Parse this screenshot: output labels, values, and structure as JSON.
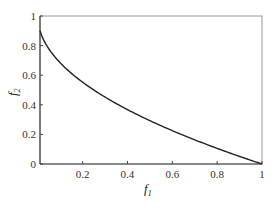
{
  "chart_data": {
    "type": "line",
    "title": "",
    "xlabel": "f1",
    "ylabel": "f2",
    "xlim": [
      0.01,
      1.0
    ],
    "ylim": [
      0,
      1
    ],
    "grid": false,
    "legend": null,
    "xticks": [
      "0.2",
      "0.4",
      "0.6",
      "0.8",
      "1"
    ],
    "yticks": [
      "0",
      "0.2",
      "0.4",
      "0.6",
      "0.8",
      "1"
    ],
    "series": [
      {
        "name": "Pareto front",
        "color": "#222222",
        "x": [
          0.01,
          0.05,
          0.1,
          0.15,
          0.2,
          0.3,
          0.4,
          0.5,
          0.6,
          0.7,
          0.8,
          0.9,
          1.0
        ],
        "y": [
          0.95,
          0.78,
          0.68,
          0.61,
          0.55,
          0.45,
          0.37,
          0.29,
          0.23,
          0.16,
          0.11,
          0.05,
          0.0
        ]
      }
    ]
  },
  "axes": {
    "xlabel_main": "f",
    "xlabel_sub": "1",
    "ylabel_main": "f",
    "ylabel_sub": "2"
  }
}
